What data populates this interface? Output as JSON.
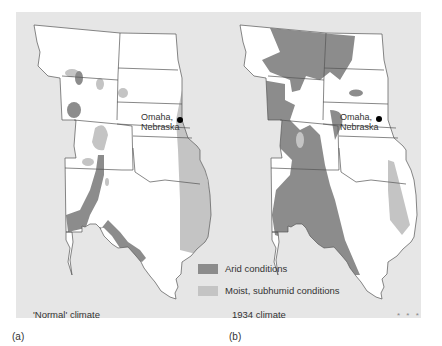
{
  "figure": {
    "panels": [
      {
        "id": "a",
        "label": "(a)",
        "caption": "'Normal' climate"
      },
      {
        "id": "b",
        "label": "(b)",
        "caption": "1934 climate"
      }
    ],
    "city": {
      "name_line1": "Omaha,",
      "name_line2": "Nebraska"
    },
    "legend": [
      {
        "label": "Arid conditions",
        "color": "#8c8c8c"
      },
      {
        "label": "Moist, subhumid conditions",
        "color": "#c4c4c4"
      }
    ],
    "ornament": "* * *"
  },
  "colors": {
    "background": "#e6e6e6",
    "land": "#ffffff",
    "arid": "#8c8c8c",
    "moist": "#c4c4c4",
    "border": "#555555"
  }
}
